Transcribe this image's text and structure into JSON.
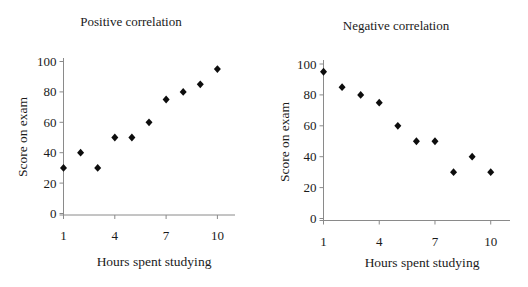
{
  "chart_data": [
    {
      "type": "scatter",
      "title": "Positive correlation",
      "xlabel": "Hours spent studying",
      "ylabel": "Score on exam",
      "x": [
        1,
        2,
        3,
        4,
        5,
        6,
        7,
        8,
        9,
        10
      ],
      "y": [
        30,
        40,
        30,
        50,
        50,
        60,
        75,
        80,
        85,
        95
      ],
      "xticks": [
        1,
        4,
        7,
        10
      ],
      "yticks": [
        0,
        20,
        40,
        60,
        80,
        100
      ],
      "xlim": [
        1,
        11
      ],
      "ylim": [
        0,
        100
      ],
      "grid": false,
      "legend": false,
      "marker": "diamond",
      "marker_color": "#0d0d0d",
      "axis_color": "#8a8a8a"
    },
    {
      "type": "scatter",
      "title": "Negative correlation",
      "xlabel": "Hours spent studying",
      "ylabel": "Score on exam",
      "x": [
        1,
        2,
        3,
        4,
        5,
        6,
        7,
        8,
        9,
        10
      ],
      "y": [
        95,
        85,
        80,
        75,
        60,
        50,
        50,
        30,
        40,
        30
      ],
      "xticks": [
        1,
        4,
        7,
        10
      ],
      "yticks": [
        0,
        20,
        40,
        60,
        80,
        100
      ],
      "xlim": [
        1,
        11
      ],
      "ylim": [
        0,
        100
      ],
      "grid": false,
      "legend": false,
      "marker": "diamond",
      "marker_color": "#0d0d0d",
      "axis_color": "#8a8a8a"
    }
  ]
}
